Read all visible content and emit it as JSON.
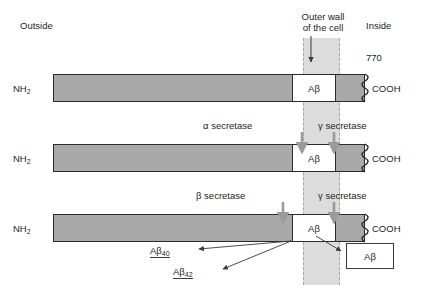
{
  "diagram": {
    "title_labels": {
      "outside": "Outside",
      "inside": "Inside",
      "outer_wall": "Outer wall\nof the cell",
      "outer_wall_line1": "Outer wall",
      "outer_wall_line2": "of the cell",
      "residue_count": "770"
    },
    "terminus": {
      "n_term": "NH",
      "n_term_sub": "2",
      "c_term": "COOH"
    },
    "segment_label": {
      "a": "A",
      "beta": "β",
      "full": "Aβ"
    },
    "rows": [
      {
        "id": "row-intact",
        "n_term": "NH2",
        "c_term": "COOH",
        "segment": "Aβ",
        "enzymes": []
      },
      {
        "id": "row-alpha-gamma",
        "n_term": "NH2",
        "c_term": "COOH",
        "segment": "Aβ",
        "enzymes": [
          {
            "name": "α secretase",
            "greek": "α",
            "word": "secretase"
          },
          {
            "name": "γ secretase",
            "greek": "γ",
            "word": "secretase"
          }
        ]
      },
      {
        "id": "row-beta-gamma",
        "n_term": "NH2",
        "c_term": "COOH",
        "segment": "Aβ",
        "enzymes": [
          {
            "name": "β secretase",
            "greek": "β",
            "word": "secretase"
          },
          {
            "name": "γ secretase",
            "greek": "γ",
            "word": "secretase"
          }
        ]
      }
    ],
    "enzyme_labels": {
      "alpha_secretase": "α secretase",
      "beta_secretase": "β secretase",
      "gamma_secretase_row2": "γ secretase",
      "gamma_secretase_row3": "γ secretase"
    },
    "products": {
      "ab40": "Aβ",
      "ab40_sub": "40",
      "ab42": "Aβ",
      "ab42_sub": "42",
      "boxed_product": "Aβ"
    },
    "colors": {
      "protein_gray": "#a9a9a9",
      "membrane_gray": "#dcdcdc",
      "membrane_border": "#a6a6a6",
      "outline": "#2b2b2b",
      "arrow_gray": "#9a9a9a",
      "text": "#231f20",
      "background": "#ffffff"
    }
  }
}
